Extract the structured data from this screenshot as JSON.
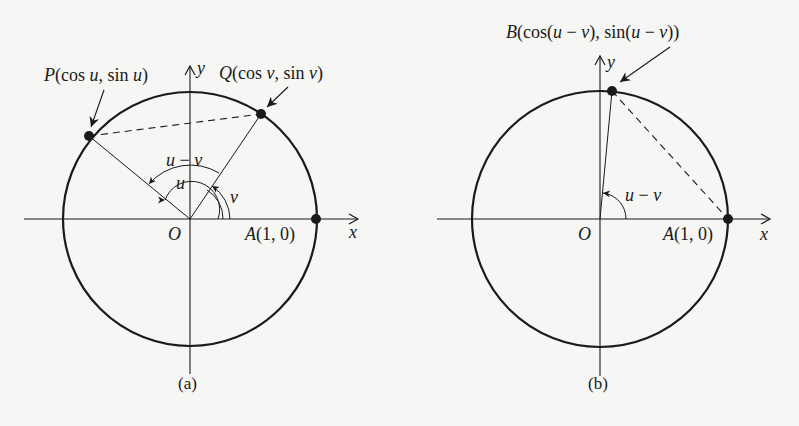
{
  "figure_a": {
    "caption": "(a)",
    "point_P": {
      "name": "P",
      "open": "(cos ",
      "var1": "u",
      "mid": ", sin ",
      "var2": "u",
      "close": ")"
    },
    "point_Q": {
      "name": "Q",
      "open": "(cos ",
      "var1": "v",
      "mid": ", sin ",
      "var2": "v",
      "close": ")"
    },
    "point_A": {
      "name": "A",
      "coords": "(1, 0)"
    },
    "origin": "O",
    "x_axis": "x",
    "y_axis": "y",
    "angle_u_minus_v": {
      "a": "u",
      "op": " − ",
      "b": "v"
    },
    "angle_u": "u",
    "angle_v": "v"
  },
  "figure_b": {
    "caption": "(b)",
    "point_B": {
      "name": "B",
      "open": "(cos(",
      "a1": "u",
      "op1": " − ",
      "b1": "v",
      "mid": "), sin(",
      "a2": "u",
      "op2": " − ",
      "b2": "v",
      "close": "))"
    },
    "point_A": {
      "name": "A",
      "coords": "(1, 0)"
    },
    "origin": "O",
    "x_axis": "x",
    "y_axis": "y",
    "angle_u_minus_v": {
      "a": "u",
      "op": " − ",
      "b": "v"
    }
  },
  "colors": {
    "ink": "#1a1a1a",
    "paper": "#f6f6f4"
  }
}
